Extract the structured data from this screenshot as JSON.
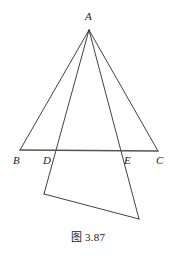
{
  "figure": {
    "caption": "图 3.87",
    "stroke_color": "#2b2b2b",
    "baseline_color": "#555555",
    "background_color": "#ffffff",
    "labels": {
      "apex": "A",
      "base_left": "B",
      "base_inner_left": "D",
      "base_inner_right": "E",
      "base_right": "C"
    },
    "points": {
      "A": {
        "x": 89,
        "y": 30
      },
      "B": {
        "x": 20,
        "y": 150
      },
      "D": {
        "x": 55,
        "y": 153
      },
      "E": {
        "x": 122,
        "y": 152
      },
      "C": {
        "x": 158,
        "y": 151
      },
      "F": {
        "x": 44,
        "y": 194
      },
      "G": {
        "x": 139,
        "y": 219
      }
    },
    "segments": [
      {
        "name": "segment-A-B",
        "from": "A",
        "to": "B"
      },
      {
        "name": "segment-A-C",
        "from": "A",
        "to": "C"
      },
      {
        "name": "segment-A-F",
        "from": "A",
        "to": "F"
      },
      {
        "name": "segment-A-G",
        "from": "A",
        "to": "G"
      },
      {
        "name": "segment-F-G",
        "from": "F",
        "to": "G"
      }
    ],
    "baseline": {
      "name": "segment-B-C",
      "from": "B",
      "to": "C"
    }
  }
}
